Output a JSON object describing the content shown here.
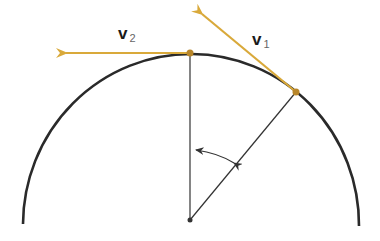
{
  "diagram": {
    "type": "circular-motion-velocity",
    "colors": {
      "arc": "#2a2a2a",
      "vector": "#d9a93a",
      "radius": "#333333",
      "point": "#b8862a"
    },
    "labels": {
      "v1": {
        "main": "v",
        "sub": "1"
      },
      "v2": {
        "main": "v",
        "sub": "2"
      }
    },
    "center": {
      "x": 190,
      "y": 220
    },
    "radius": 167,
    "points": [
      {
        "name": "p2",
        "x": 190,
        "y": 53
      },
      {
        "name": "p1",
        "x": 296,
        "y": 92
      }
    ]
  }
}
